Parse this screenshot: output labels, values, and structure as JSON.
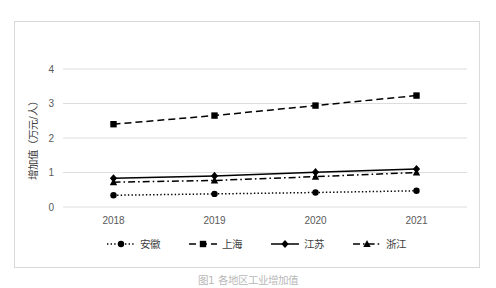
{
  "chart_data": {
    "type": "line",
    "title": "",
    "xlabel": "",
    "ylabel": "增加值（万元/人）",
    "categories": [
      "2018",
      "2019",
      "2020",
      "2021"
    ],
    "ylim": [
      0,
      4
    ],
    "yticks": [
      "0",
      "1",
      "2",
      "3",
      "4"
    ],
    "grid": true,
    "legend_position": "bottom",
    "series": [
      {
        "name": "安徽",
        "marker": "circle",
        "linestyle": "dotted",
        "color": "#000000",
        "values": [
          0.34,
          0.38,
          0.42,
          0.47
        ]
      },
      {
        "name": "上海",
        "marker": "square",
        "linestyle": "dashed",
        "color": "#000000",
        "values": [
          2.4,
          2.65,
          2.94,
          3.23
        ]
      },
      {
        "name": "江苏",
        "marker": "diamond",
        "linestyle": "solid",
        "color": "#000000",
        "values": [
          0.83,
          0.9,
          1.01,
          1.1
        ]
      },
      {
        "name": "浙江",
        "marker": "triangle",
        "linestyle": "dashdot",
        "color": "#000000",
        "values": [
          0.72,
          0.77,
          0.88,
          1.0
        ]
      }
    ]
  },
  "caption": {
    "text": "图1  各地区工业增加值"
  },
  "style": {
    "grid_color": "#d9d9d9",
    "border_color": "#d9d9d9",
    "tick_label_color": "#595959",
    "text_color": "#404040"
  }
}
